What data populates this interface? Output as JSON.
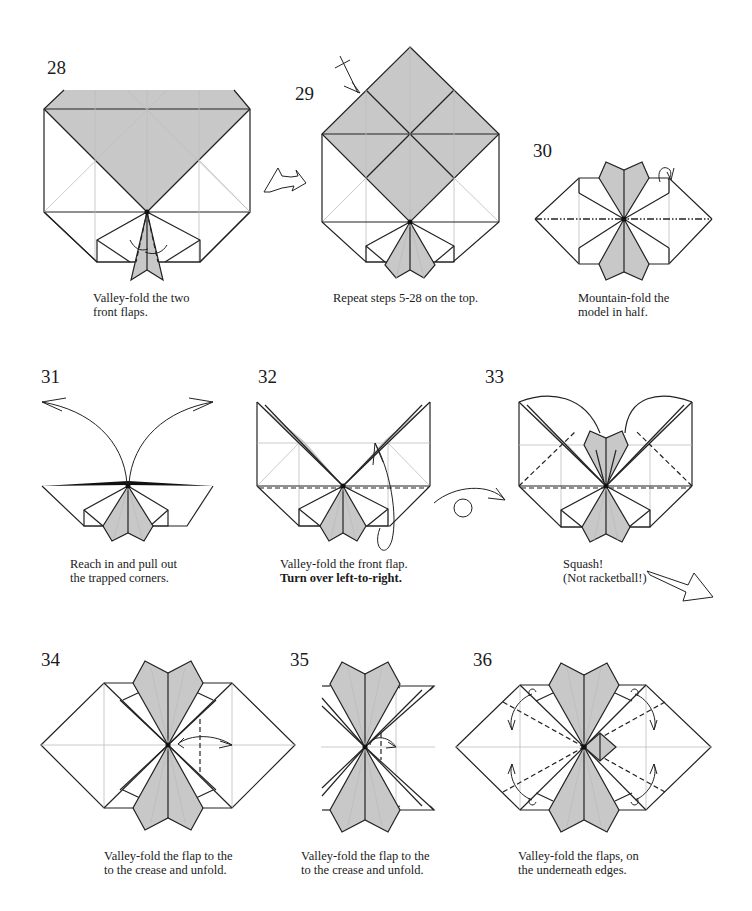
{
  "page": {
    "background": "#ffffff",
    "paper_shade_color": "#c8c8c8",
    "line_color": "#222222"
  },
  "steps": [
    {
      "number": "28",
      "caption": [
        "Valley-fold the two",
        "front flaps."
      ],
      "bold_line": null,
      "fold_type": "valley-fold"
    },
    {
      "number": "29",
      "caption": [
        "Repeat steps 5-28 on the top."
      ],
      "bold_line": null,
      "fold_type": "repeat"
    },
    {
      "number": "30",
      "caption": [
        "Mountain-fold the",
        "model in half."
      ],
      "bold_line": null,
      "fold_type": "mountain-fold"
    },
    {
      "number": "31",
      "caption": [
        "Reach in and pull out",
        "the trapped corners."
      ],
      "bold_line": null,
      "fold_type": "pull-out"
    },
    {
      "number": "32",
      "caption": [
        "Valley-fold the front flap."
      ],
      "bold_line": "Turn over left-to-right.",
      "fold_type": "valley-fold-turn-over"
    },
    {
      "number": "33",
      "caption": [
        "Squash!",
        "(Not racketball!)"
      ],
      "bold_line": null,
      "fold_type": "squash"
    },
    {
      "number": "34",
      "caption": [
        "Valley-fold the flap to the",
        "to the crease and unfold."
      ],
      "bold_line": null,
      "fold_type": "valley-fold-unfold"
    },
    {
      "number": "35",
      "caption": [
        "Valley-fold the flap to the",
        "to the crease and unfold."
      ],
      "bold_line": null,
      "fold_type": "valley-fold-unfold"
    },
    {
      "number": "36",
      "caption": [
        "Valley-fold the flaps, on",
        "the underneath edges."
      ],
      "bold_line": null,
      "fold_type": "valley-fold"
    }
  ],
  "symbols": {
    "step_arrow_28_29": "hollow-arrow-icon",
    "step_arrow_33_34": "hollow-arrow-icon",
    "turn_over_32": "turn-over-icon",
    "repeat_29": "repeat-arrow-icon"
  }
}
